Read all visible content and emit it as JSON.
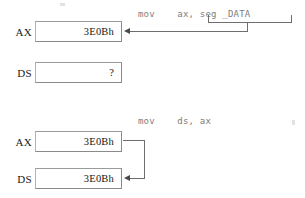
{
  "diagram": {
    "background_color": "#ffffff",
    "line_color": "#6e6e6e",
    "code_color": "#7d7d7d",
    "text_color": "#1a1a1a",
    "steps": [
      {
        "id": "step-1",
        "instruction": "mov    ax, seg _DATA",
        "instruction_parts": {
          "mnemonic": "mov",
          "destination": "ax,",
          "source": "seg _DATA"
        },
        "bracket_label": "seg _DATA",
        "registers": [
          {
            "name": "AX",
            "value": "3E0Bh"
          },
          {
            "name": "DS",
            "value": "?"
          }
        ]
      },
      {
        "id": "step-2",
        "instruction": "mov    ds, ax",
        "instruction_parts": {
          "mnemonic": "mov",
          "destination": "ds,",
          "source": "ax"
        },
        "registers": [
          {
            "name": "AX",
            "value": "3E0Bh"
          },
          {
            "name": "DS",
            "value": "3E0Bh"
          }
        ]
      }
    ]
  }
}
